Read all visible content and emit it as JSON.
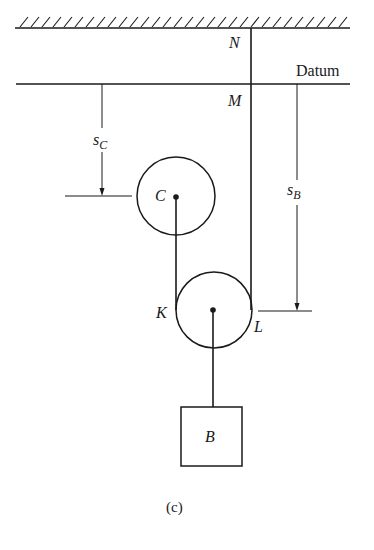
{
  "figure": {
    "caption": "(c)",
    "datum_label": "Datum",
    "points": {
      "N": "N",
      "M": "M",
      "K": "K",
      "L": "L"
    },
    "pulleys": {
      "upper": {
        "label": "C"
      },
      "lower": {
        "label": ""
      }
    },
    "block": {
      "label": "B"
    },
    "dimensions": {
      "s_c": {
        "base": "s",
        "sub": "C"
      },
      "s_b": {
        "base": "s",
        "sub": "B"
      }
    },
    "colors": {
      "ink": "#1a1a1a",
      "background": "#ffffff"
    }
  }
}
